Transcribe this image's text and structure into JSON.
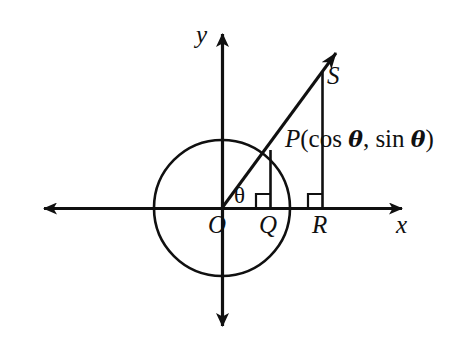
{
  "figure": {
    "type": "unit-circle-trigonometry-diagram",
    "background_color": "#ffffff",
    "stroke_color": "#101010",
    "axes": {
      "x_axis_label": "x",
      "y_axis_label": "y",
      "x_axis_start_x": 38,
      "x_axis_end_x": 408,
      "y_axis_top_y": 28,
      "y_axis_bottom_y": 332,
      "origin": {
        "x": 222,
        "y": 208
      }
    },
    "circle": {
      "center_x": 222,
      "center_y": 208,
      "radius": 68
    },
    "points": [
      {
        "name": "origin-point",
        "label": "O",
        "x": 222,
        "y": 208
      },
      {
        "name": "q-point",
        "label": "Q",
        "x": 270,
        "y": 208
      },
      {
        "name": "r-point",
        "label": "R",
        "x": 322,
        "y": 208
      },
      {
        "name": "p-point",
        "label": "P(cos θ, sin θ)",
        "x": 270,
        "y": 150
      },
      {
        "name": "s-point",
        "label": "S",
        "x": 322,
        "y": 71
      }
    ],
    "angle": {
      "label": "θ",
      "vertex_x": 222,
      "vertex_y": 208,
      "degrees": 50
    },
    "p_label_parts": {
      "p": "P",
      "open": "(cos ",
      "theta1": "θ",
      "comma": ", sin ",
      "theta2": "θ",
      "close": ")"
    },
    "ray": {
      "from_x": 222,
      "from_y": 208,
      "to_x": 341,
      "to_y": 47
    },
    "segments": [
      {
        "name": "pq-perpendicular",
        "x1": 270,
        "y1": 150,
        "x2": 270,
        "y2": 208
      },
      {
        "name": "sr-perpendicular",
        "x1": 322,
        "y1": 71,
        "x2": 322,
        "y2": 208
      }
    ],
    "right_angle_marks": [
      {
        "name": "right-angle-q",
        "x": 256,
        "y": 194,
        "size": 14
      },
      {
        "name": "right-angle-r",
        "x": 308,
        "y": 194,
        "size": 14
      }
    ]
  }
}
